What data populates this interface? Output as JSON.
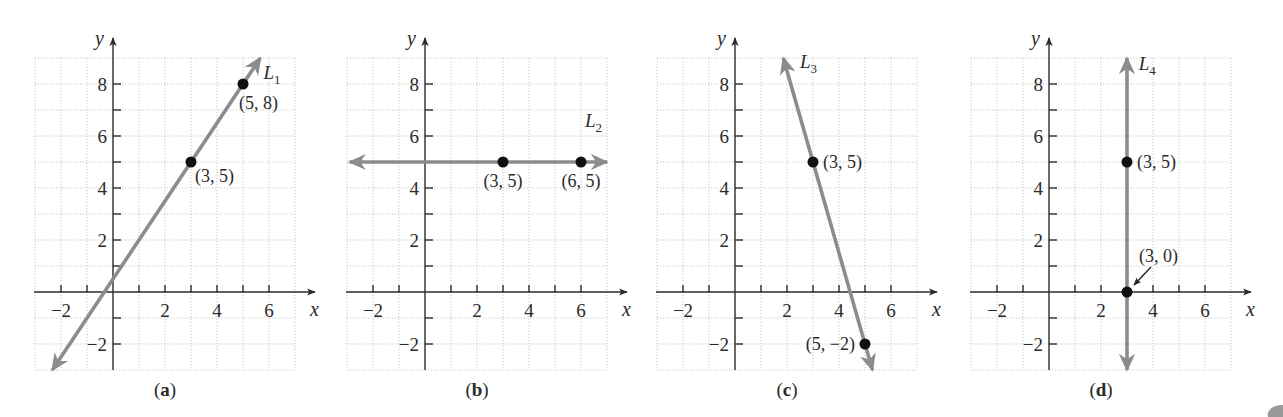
{
  "figure": {
    "width": 1283,
    "height": 417,
    "colors": {
      "line": "#8c8c8c",
      "point": "#111111",
      "axis": "#2a2a2a",
      "grid": "#b8b8b8"
    },
    "layout": {
      "unit_px": 26,
      "x_axis_y": 292,
      "origins_x": [
        113,
        425,
        735,
        1049
      ]
    }
  },
  "chart_data": [
    {
      "type": "line",
      "panel": "a",
      "caption": "(a)",
      "title": "",
      "xlabel": "x",
      "ylabel": "y",
      "xlim": [
        -3,
        7
      ],
      "ylim": [
        -3,
        9
      ],
      "grid": true,
      "x_ticks": [
        -2,
        -1,
        1,
        2,
        3,
        4,
        5,
        6
      ],
      "x_tick_labels": [
        "−2",
        "2",
        "4",
        "6"
      ],
      "y_ticks": [
        -2,
        -1,
        1,
        2,
        3,
        4,
        5,
        6,
        7,
        8
      ],
      "y_tick_labels": [
        "−2",
        "2",
        "4",
        "6",
        "8"
      ],
      "line": {
        "name": "L1",
        "label": "L",
        "subscript": "1",
        "slope": 1.5,
        "intercept": 0.5,
        "from": [
          -2.333,
          -3
        ],
        "to": [
          5.667,
          9
        ]
      },
      "points": [
        {
          "x": 3,
          "y": 5,
          "label": "(3, 5)"
        },
        {
          "x": 5,
          "y": 8,
          "label": "(5, 8)"
        }
      ]
    },
    {
      "type": "line",
      "panel": "b",
      "caption": "(b)",
      "title": "",
      "xlabel": "x",
      "ylabel": "y",
      "xlim": [
        -3,
        7
      ],
      "ylim": [
        -3,
        9
      ],
      "grid": true,
      "x_ticks": [
        -2,
        -1,
        1,
        2,
        3,
        4,
        5,
        6
      ],
      "x_tick_labels": [
        "−2",
        "2",
        "4",
        "6"
      ],
      "y_ticks": [
        -2,
        -1,
        1,
        2,
        3,
        4,
        5,
        6,
        7,
        8
      ],
      "y_tick_labels": [
        "−2",
        "2",
        "4",
        "6",
        "8"
      ],
      "line": {
        "name": "L2",
        "label": "L",
        "subscript": "2",
        "slope": 0,
        "intercept": 5,
        "from": [
          -2.9,
          5
        ],
        "to": [
          7,
          5
        ]
      },
      "points": [
        {
          "x": 3,
          "y": 5,
          "label": "(3, 5)"
        },
        {
          "x": 6,
          "y": 5,
          "label": "(6, 5)"
        }
      ]
    },
    {
      "type": "line",
      "panel": "c",
      "caption": "(c)",
      "title": "",
      "xlabel": "x",
      "ylabel": "y",
      "xlim": [
        -3,
        7
      ],
      "ylim": [
        -3,
        9
      ],
      "grid": true,
      "x_ticks": [
        -2,
        -1,
        1,
        2,
        3,
        4,
        5,
        6
      ],
      "x_tick_labels": [
        "−2",
        "2",
        "4",
        "6"
      ],
      "y_ticks": [
        -2,
        -1,
        1,
        2,
        3,
        4,
        5,
        6,
        7,
        8
      ],
      "y_tick_labels": [
        "−2",
        "2",
        "4",
        "6",
        "8"
      ],
      "line": {
        "name": "L3",
        "label": "L",
        "subscript": "3",
        "slope": -3.5,
        "intercept": 15.5,
        "from": [
          1.857,
          9
        ],
        "to": [
          5.286,
          -3
        ]
      },
      "points": [
        {
          "x": 3,
          "y": 5,
          "label": "(3, 5)"
        },
        {
          "x": 5,
          "y": -2,
          "label": "(5, −2)"
        }
      ]
    },
    {
      "type": "line",
      "panel": "d",
      "caption": "(d)",
      "title": "",
      "xlabel": "x",
      "ylabel": "y",
      "xlim": [
        -3,
        7
      ],
      "ylim": [
        -3,
        9
      ],
      "grid": true,
      "x_ticks": [
        -2,
        -1,
        1,
        2,
        3,
        4,
        5,
        6
      ],
      "x_tick_labels": [
        "−2",
        "2",
        "4",
        "6"
      ],
      "y_ticks": [
        -2,
        -1,
        1,
        2,
        3,
        4,
        5,
        6,
        7,
        8
      ],
      "y_tick_labels": [
        "−2",
        "2",
        "4",
        "6",
        "8"
      ],
      "line": {
        "name": "L4",
        "label": "L",
        "subscript": "4",
        "vertical_x": 3,
        "from": [
          3,
          -3
        ],
        "to": [
          3,
          9
        ]
      },
      "points": [
        {
          "x": 3,
          "y": 5,
          "label": "(3, 5)"
        },
        {
          "x": 3,
          "y": 0,
          "label": "(3, 0)",
          "pointer": true
        }
      ]
    }
  ]
}
